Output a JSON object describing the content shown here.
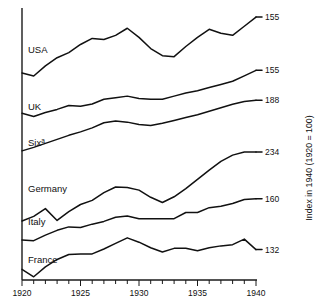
{
  "chart_data": {
    "type": "line",
    "title": "",
    "xlabel": "",
    "ylabel": "Index in 1940 (1920 = 100)",
    "xlim": [
      1920,
      1940
    ],
    "xticks": [
      1920,
      1925,
      1930,
      1935,
      1940
    ],
    "xtick_labels": [
      "1920",
      "1925",
      "1930",
      "1935",
      "1940"
    ],
    "minor_tick_step": 1,
    "grid": false,
    "legend": "inline-left-labels",
    "note_marker": "a",
    "series": [
      {
        "name": "USA",
        "label": "USA",
        "end_value": "155",
        "end_value_num": 155,
        "x": [
          1920,
          1921,
          1922,
          1923,
          1924,
          1925,
          1926,
          1927,
          1928,
          1929,
          1930,
          1931,
          1932,
          1933,
          1934,
          1935,
          1936,
          1937,
          1938,
          1939,
          1940
        ],
        "values": [
          100,
          97,
          107,
          115,
          120,
          128,
          134,
          133,
          137,
          144,
          135,
          124,
          117,
          116,
          126,
          135,
          143,
          139,
          137,
          146,
          155
        ]
      },
      {
        "name": "UK",
        "label": "UK",
        "end_value": "155",
        "end_value_num": 155,
        "x": [
          1920,
          1921,
          1922,
          1923,
          1924,
          1925,
          1926,
          1927,
          1928,
          1929,
          1930,
          1931,
          1932,
          1933,
          1934,
          1935,
          1936,
          1937,
          1938,
          1939,
          1940
        ],
        "values": [
          100,
          96,
          101,
          105,
          110,
          109,
          112,
          118,
          120,
          122,
          119,
          118,
          118,
          122,
          126,
          129,
          133,
          137,
          141,
          148,
          155
        ]
      },
      {
        "name": "Six",
        "label": "Six",
        "superscript": "a",
        "end_value": "188",
        "end_value_num": 188,
        "x": [
          1920,
          1921,
          1922,
          1923,
          1924,
          1925,
          1926,
          1927,
          1928,
          1929,
          1930,
          1931,
          1932,
          1933,
          1934,
          1935,
          1936,
          1937,
          1938,
          1939,
          1940
        ],
        "values": [
          100,
          106,
          113,
          120,
          127,
          133,
          140,
          149,
          152,
          150,
          146,
          144,
          148,
          153,
          158,
          163,
          169,
          175,
          181,
          186,
          188
        ]
      },
      {
        "name": "Germany",
        "label": "Germany",
        "end_value": "234",
        "end_value_num": 234,
        "x": [
          1920,
          1921,
          1922,
          1923,
          1924,
          1925,
          1926,
          1927,
          1928,
          1929,
          1930,
          1931,
          1932,
          1933,
          1934,
          1935,
          1936,
          1937,
          1938,
          1939,
          1940
        ],
        "values": [
          100,
          109,
          124,
          101,
          118,
          132,
          140,
          155,
          166,
          165,
          160,
          146,
          136,
          147,
          163,
          181,
          199,
          216,
          228,
          234,
          234
        ]
      },
      {
        "name": "Italy",
        "label": "Italy",
        "end_value": "160",
        "end_value_num": 160,
        "x": [
          1920,
          1921,
          1922,
          1923,
          1924,
          1925,
          1926,
          1927,
          1928,
          1929,
          1930,
          1931,
          1932,
          1933,
          1934,
          1935,
          1936,
          1937,
          1938,
          1939,
          1940
        ],
        "values": [
          100,
          99,
          107,
          114,
          119,
          118,
          123,
          127,
          133,
          135,
          131,
          131,
          131,
          131,
          140,
          140,
          147,
          149,
          153,
          159,
          160
        ]
      },
      {
        "name": "France",
        "label": "France",
        "end_value": "132",
        "end_value_num": 132,
        "x": [
          1920,
          1921,
          1922,
          1923,
          1924,
          1925,
          1926,
          1927,
          1928,
          1929,
          1930,
          1931,
          1932,
          1933,
          1934,
          1935,
          1936,
          1937,
          1938,
          1939,
          1940
        ],
        "values": [
          100,
          88,
          104,
          116,
          124,
          125,
          125,
          133,
          142,
          151,
          144,
          135,
          128,
          134,
          134,
          130,
          135,
          138,
          140,
          149,
          132
        ]
      }
    ]
  },
  "axis": {
    "y_title": "Index in 1940 (1920 = 100)"
  },
  "colors": {
    "line": "#111111",
    "axis": "#1a1a1a",
    "background": "#ffffff"
  }
}
